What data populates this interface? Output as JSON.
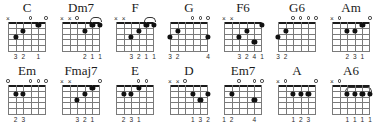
{
  "sheet": {
    "title": "Guitar Chord Diagram Chart",
    "strings": 6,
    "frets": 5,
    "colors": {
      "ink": "#1a1a1a",
      "grid": "#7a7a7a",
      "dot": "#111111",
      "background": "#ffffff"
    },
    "marker_glyphs": {
      "open": "o",
      "muted": "x"
    }
  },
  "rows": [
    {
      "chords": [
        {
          "name": "C",
          "markers": [
            "x",
            "",
            "",
            "o",
            "",
            "o"
          ],
          "dots": [
            {
              "string": 5,
              "fret": 3
            },
            {
              "string": 4,
              "fret": 2
            },
            {
              "string": 2,
              "fret": 1
            }
          ],
          "barre": null,
          "fingering": [
            "",
            "3",
            "2",
            "",
            "1",
            ""
          ]
        },
        {
          "name": "Dm7",
          "markers": [
            "x",
            "x",
            "o",
            "",
            "",
            ""
          ],
          "dots": [
            {
              "string": 3,
              "fret": 2
            },
            {
              "string": 2,
              "fret": 1
            },
            {
              "string": 1,
              "fret": 1
            }
          ],
          "barre": {
            "fret": 1,
            "from_string": 2,
            "to_string": 1,
            "over_nut": true
          },
          "fingering": [
            "",
            "",
            "",
            "2",
            "1",
            "1"
          ]
        },
        {
          "name": "F",
          "markers": [
            "x",
            "x",
            "",
            "",
            "",
            ""
          ],
          "dots": [
            {
              "string": 4,
              "fret": 3
            },
            {
              "string": 3,
              "fret": 2
            },
            {
              "string": 2,
              "fret": 1
            },
            {
              "string": 1,
              "fret": 1
            }
          ],
          "barre": {
            "fret": 1,
            "from_string": 2,
            "to_string": 1,
            "over_nut": true
          },
          "fingering": [
            "",
            "",
            "3",
            "2",
            "1",
            "1"
          ]
        },
        {
          "name": "G",
          "markers": [
            "",
            "",
            "",
            "o",
            "o",
            "o"
          ],
          "dots": [
            {
              "string": 6,
              "fret": 3
            },
            {
              "string": 5,
              "fret": 2
            },
            {
              "string": 1,
              "fret": 3
            }
          ],
          "barre": null,
          "fingering": [
            "3",
            "2",
            "",
            "",
            "",
            "4"
          ]
        },
        {
          "name": "F6",
          "markers": [
            "x",
            "x",
            "",
            "",
            "",
            ""
          ],
          "dots": [
            {
              "string": 4,
              "fret": 3
            },
            {
              "string": 3,
              "fret": 2
            },
            {
              "string": 2,
              "fret": 4
            },
            {
              "string": 1,
              "fret": 1
            }
          ],
          "barre": null,
          "fingering": [
            "",
            "",
            "3",
            "2",
            "4",
            "1"
          ]
        },
        {
          "name": "G6",
          "markers": [
            "",
            "",
            "o",
            "o",
            "o",
            "o"
          ],
          "dots": [
            {
              "string": 6,
              "fret": 3
            },
            {
              "string": 5,
              "fret": 2
            }
          ],
          "barre": null,
          "fingering": [
            "3",
            "2",
            "",
            "",
            "",
            ""
          ]
        },
        {
          "name": "Am",
          "markers": [
            "x",
            "o",
            "",
            "",
            "",
            "o"
          ],
          "dots": [
            {
              "string": 4,
              "fret": 2
            },
            {
              "string": 3,
              "fret": 2
            },
            {
              "string": 2,
              "fret": 1
            }
          ],
          "barre": null,
          "fingering": [
            "",
            "",
            "2",
            "3",
            "1",
            ""
          ]
        }
      ]
    },
    {
      "chords": [
        {
          "name": "Em",
          "markers": [
            "o",
            "",
            "",
            "o",
            "o",
            "o"
          ],
          "dots": [
            {
              "string": 5,
              "fret": 2
            },
            {
              "string": 4,
              "fret": 2
            }
          ],
          "barre": null,
          "fingering": [
            "",
            "2",
            "3",
            "",
            "",
            ""
          ]
        },
        {
          "name": "Fmaj7",
          "markers": [
            "x",
            "x",
            "",
            "",
            "",
            "o"
          ],
          "dots": [
            {
              "string": 4,
              "fret": 3
            },
            {
              "string": 3,
              "fret": 2
            },
            {
              "string": 2,
              "fret": 1
            }
          ],
          "barre": null,
          "fingering": [
            "",
            "",
            "3",
            "2",
            "1",
            ""
          ]
        },
        {
          "name": "E",
          "markers": [
            "",
            "",
            "",
            "o",
            "o",
            ""
          ],
          "dots": [
            {
              "string": 5,
              "fret": 2
            },
            {
              "string": 4,
              "fret": 2
            },
            {
              "string": 3,
              "fret": 1
            }
          ],
          "barre": null,
          "fingering": [
            "",
            "2",
            "3",
            "1",
            "",
            ""
          ]
        },
        {
          "name": "D",
          "markers": [
            "x",
            "x",
            "o",
            "",
            "",
            ""
          ],
          "dots": [
            {
              "string": 3,
              "fret": 2
            },
            {
              "string": 2,
              "fret": 3
            },
            {
              "string": 1,
              "fret": 2
            }
          ],
          "barre": null,
          "fingering": [
            "",
            "",
            "",
            "1",
            "3",
            "2"
          ]
        },
        {
          "name": "Em7",
          "markers": [
            "",
            "",
            "o",
            "",
            "o",
            "o"
          ],
          "dots": [
            {
              "string": 5,
              "fret": 2
            },
            {
              "string": 2,
              "fret": 3
            }
          ],
          "barre": null,
          "fingering": [
            "1",
            "2",
            "",
            "",
            "4",
            ""
          ]
        },
        {
          "name": "A",
          "markers": [
            "x",
            "o",
            "",
            "",
            "",
            "o"
          ],
          "dots": [
            {
              "string": 4,
              "fret": 2
            },
            {
              "string": 3,
              "fret": 2
            },
            {
              "string": 2,
              "fret": 2
            }
          ],
          "barre": null,
          "fingering": [
            "",
            "",
            "1",
            "2",
            "3",
            ""
          ]
        },
        {
          "name": "A6",
          "markers": [
            "x",
            "o",
            "",
            "",
            "",
            ""
          ],
          "dots": [
            {
              "string": 4,
              "fret": 2
            },
            {
              "string": 3,
              "fret": 2
            },
            {
              "string": 2,
              "fret": 2
            },
            {
              "string": 1,
              "fret": 2
            }
          ],
          "barre": {
            "fret": 2,
            "from_string": 4,
            "to_string": 1,
            "over_nut": false
          },
          "fingering": [
            "",
            "",
            "1",
            "1",
            "1",
            "1"
          ]
        }
      ]
    }
  ]
}
